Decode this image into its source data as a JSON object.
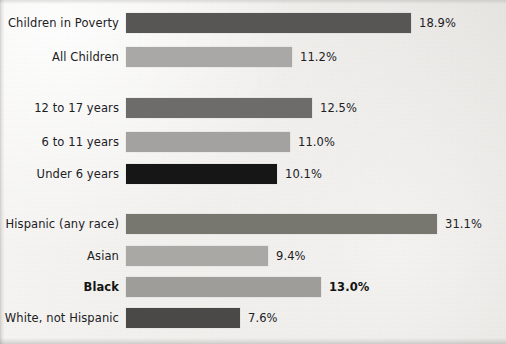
{
  "chart_data": {
    "type": "bar",
    "orientation": "horizontal",
    "title": "",
    "subtitle": "",
    "xlabel": "",
    "ylabel": "",
    "grid": false,
    "legend": false,
    "value_suffix": "%",
    "baseline_x_px": 126,
    "groups": [
      {
        "name": "overall",
        "rows": [
          {
            "label": "Children in Poverty",
            "value": 18.9,
            "value_label": "18.9%",
            "bar_color": "#585654",
            "bar_end_px": 411,
            "bold": false,
            "row_top_px": 11
          },
          {
            "label": "All Children",
            "value": 11.2,
            "value_label": "11.2%",
            "bar_color": "#a9a8a6",
            "bar_end_px": 292,
            "bold": false,
            "row_top_px": 45
          }
        ]
      },
      {
        "name": "age",
        "rows": [
          {
            "label": "12 to 17 years",
            "value": 12.5,
            "value_label": "12.5%",
            "bar_color": "#6e6c6a",
            "bar_end_px": 312,
            "bold": false,
            "row_top_px": 96
          },
          {
            "label": "6 to 11 years",
            "value": 11.0,
            "value_label": "11.0%",
            "bar_color": "#a3a2a0",
            "bar_end_px": 290,
            "bold": false,
            "row_top_px": 130
          },
          {
            "label": "Under 6 years",
            "value": 10.1,
            "value_label": "10.1%",
            "bar_color": "#161616",
            "bar_end_px": 277,
            "bold": false,
            "row_top_px": 162
          }
        ]
      },
      {
        "name": "race-ethnicity",
        "rows": [
          {
            "label": "Hispanic (any race)",
            "value": 31.1,
            "value_label": "31.1%",
            "bar_color": "#77766f",
            "bar_end_px": 437,
            "bold": false,
            "row_top_px": 212
          },
          {
            "label": "Asian",
            "value": 9.4,
            "value_label": "9.4%",
            "bar_color": "#a9a8a4",
            "bar_end_px": 268,
            "bold": false,
            "row_top_px": 244
          },
          {
            "label": "Black",
            "value": 13.0,
            "value_label": "13.0%",
            "bar_color": "#9e9d99",
            "bar_end_px": 321,
            "bold": true,
            "row_top_px": 275
          },
          {
            "label": "White, not Hispanic",
            "value": 7.6,
            "value_label": "7.6%",
            "bar_color": "#4a4947",
            "bar_end_px": 240,
            "bold": false,
            "row_top_px": 306
          }
        ]
      }
    ]
  }
}
